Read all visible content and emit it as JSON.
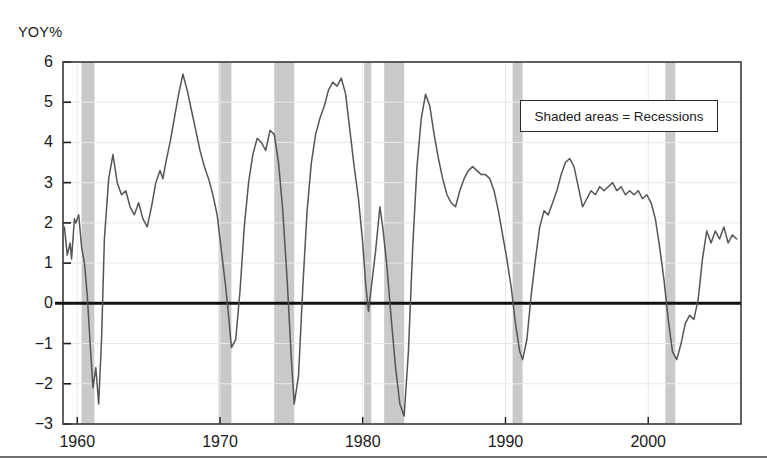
{
  "chart_data": {
    "type": "line",
    "title": "",
    "subtitle": "",
    "xlabel": "",
    "ylabel": "YOY%",
    "ylim": [
      -3,
      6
    ],
    "xlim": [
      1959.0,
      2006.5
    ],
    "grid": true,
    "zero_line": 0,
    "legend": {
      "position": "inside-top-right",
      "entries": [
        "Shaded areas = Recessions"
      ]
    },
    "yticks": [
      6,
      5,
      4,
      3,
      2,
      1,
      0,
      -1,
      -2,
      -3
    ],
    "ytick_labels": [
      "6",
      "5",
      "4",
      "3",
      "2",
      "1",
      "0",
      "−1",
      "−2",
      "−3"
    ],
    "xticks": [
      1960,
      1970,
      1980,
      1990,
      2000
    ],
    "xtick_labels": [
      "1960",
      "1970",
      "1980",
      "1990",
      "2000"
    ],
    "shaded_regions_label": "Recessions",
    "shaded_regions": [
      {
        "start": 1960.3,
        "end": 1961.2
      },
      {
        "start": 1969.9,
        "end": 1970.8
      },
      {
        "start": 1973.8,
        "end": 1975.2
      },
      {
        "start": 1980.1,
        "end": 1980.6
      },
      {
        "start": 1981.5,
        "end": 1982.9
      },
      {
        "start": 1990.5,
        "end": 1991.2
      },
      {
        "start": 2001.2,
        "end": 2001.9
      }
    ],
    "series": [
      {
        "name": "YOY%",
        "color": "#555555",
        "x": [
          1959.1,
          1959.3,
          1959.5,
          1959.6,
          1959.8,
          1959.9,
          1960.1,
          1960.3,
          1960.5,
          1960.7,
          1960.9,
          1961.1,
          1961.3,
          1961.5,
          1961.7,
          1961.9,
          1962.2,
          1962.5,
          1962.8,
          1963.1,
          1963.4,
          1963.7,
          1964.0,
          1964.3,
          1964.6,
          1964.9,
          1965.2,
          1965.5,
          1965.8,
          1966.0,
          1966.2,
          1966.5,
          1966.8,
          1967.1,
          1967.4,
          1967.7,
          1968.0,
          1968.3,
          1968.6,
          1968.9,
          1969.2,
          1969.5,
          1969.8,
          1970.1,
          1970.4,
          1970.6,
          1970.8,
          1971.1,
          1971.4,
          1971.7,
          1972.0,
          1972.3,
          1972.6,
          1972.9,
          1973.2,
          1973.5,
          1973.8,
          1974.1,
          1974.4,
          1974.7,
          1975.0,
          1975.2,
          1975.5,
          1975.8,
          1976.1,
          1976.4,
          1976.7,
          1977.0,
          1977.3,
          1977.6,
          1977.9,
          1978.2,
          1978.5,
          1978.8,
          1979.1,
          1979.4,
          1979.7,
          1980.0,
          1980.2,
          1980.4,
          1980.6,
          1980.9,
          1981.2,
          1981.4,
          1981.7,
          1982.0,
          1982.3,
          1982.6,
          1982.9,
          1983.2,
          1983.5,
          1983.8,
          1984.1,
          1984.4,
          1984.7,
          1985.0,
          1985.3,
          1985.6,
          1985.9,
          1986.2,
          1986.5,
          1986.8,
          1987.1,
          1987.4,
          1987.7,
          1988.0,
          1988.3,
          1988.6,
          1988.9,
          1989.2,
          1989.5,
          1989.8,
          1990.1,
          1990.4,
          1990.7,
          1991.0,
          1991.2,
          1991.5,
          1991.8,
          1992.1,
          1992.4,
          1992.7,
          1993.0,
          1993.3,
          1993.6,
          1993.9,
          1994.2,
          1994.5,
          1994.8,
          1995.1,
          1995.4,
          1995.7,
          1996.0,
          1996.3,
          1996.6,
          1996.9,
          1997.2,
          1997.5,
          1997.8,
          1998.1,
          1998.4,
          1998.7,
          1999.0,
          1999.3,
          1999.6,
          1999.9,
          2000.2,
          2000.5,
          2000.8,
          2001.1,
          2001.4,
          2001.7,
          2002.0,
          2002.3,
          2002.6,
          2002.9,
          2003.2,
          2003.5,
          2003.8,
          2004.1,
          2004.4,
          2004.7,
          2005.0,
          2005.3,
          2005.6,
          2005.9,
          2006.2
        ],
        "y": [
          1.9,
          1.2,
          1.5,
          1.1,
          2.1,
          2.0,
          2.2,
          1.4,
          1.0,
          0.2,
          -1.0,
          -2.1,
          -1.6,
          -2.5,
          -0.9,
          1.6,
          3.1,
          3.7,
          3.0,
          2.7,
          2.8,
          2.4,
          2.2,
          2.5,
          2.1,
          1.9,
          2.4,
          3.0,
          3.3,
          3.1,
          3.5,
          4.0,
          4.6,
          5.2,
          5.7,
          5.3,
          4.8,
          4.3,
          3.8,
          3.4,
          3.1,
          2.7,
          2.2,
          1.3,
          0.4,
          -0.3,
          -1.1,
          -0.9,
          0.3,
          1.9,
          3.0,
          3.7,
          4.1,
          4.0,
          3.8,
          4.3,
          4.2,
          3.5,
          2.3,
          0.6,
          -1.4,
          -2.5,
          -1.8,
          0.4,
          2.3,
          3.5,
          4.2,
          4.6,
          4.9,
          5.3,
          5.5,
          5.4,
          5.6,
          5.2,
          4.3,
          3.4,
          2.6,
          1.5,
          0.5,
          -0.2,
          0.4,
          1.3,
          2.4,
          1.9,
          0.9,
          -0.4,
          -1.6,
          -2.5,
          -2.8,
          -1.2,
          1.4,
          3.4,
          4.6,
          5.2,
          4.9,
          4.2,
          3.6,
          3.1,
          2.7,
          2.5,
          2.4,
          2.8,
          3.1,
          3.3,
          3.4,
          3.3,
          3.2,
          3.2,
          3.1,
          2.8,
          2.3,
          1.7,
          1.1,
          0.4,
          -0.5,
          -1.2,
          -1.4,
          -0.9,
          0.2,
          1.1,
          1.9,
          2.3,
          2.2,
          2.5,
          2.8,
          3.2,
          3.5,
          3.6,
          3.4,
          2.9,
          2.4,
          2.6,
          2.8,
          2.7,
          2.9,
          2.8,
          2.9,
          3.0,
          2.8,
          2.9,
          2.7,
          2.8,
          2.7,
          2.8,
          2.6,
          2.7,
          2.5,
          2.1,
          1.4,
          0.6,
          -0.4,
          -1.2,
          -1.4,
          -1.0,
          -0.5,
          -0.3,
          -0.4,
          0.1,
          1.1,
          1.8,
          1.5,
          1.8,
          1.6,
          1.9,
          1.5,
          1.7,
          1.6
        ]
      }
    ]
  },
  "axis": {
    "unit_label": "YOY%"
  }
}
